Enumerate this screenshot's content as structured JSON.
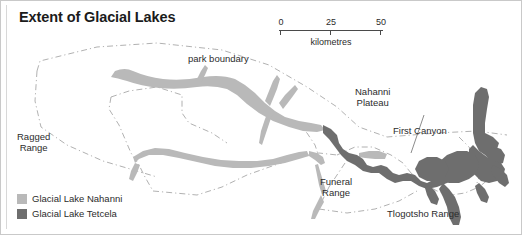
{
  "figure": {
    "title": "Extent of Glacial Lakes",
    "border_color": "#c9c9c9",
    "background": "#ffffff"
  },
  "scalebar": {
    "ticks": [
      "0",
      "25",
      "50"
    ],
    "unit_label": "kilometres",
    "line_color": "#4a4a4a"
  },
  "legend": {
    "items": [
      {
        "label": "Glacial Lake Nahanni",
        "color": "#b9b9b9"
      },
      {
        "label": "Glacial Lake Tetcela",
        "color": "#6e6e6e"
      }
    ]
  },
  "map_labels": {
    "park_boundary": "park boundary",
    "ragged_range": "Ragged\nRange",
    "nahanni_plateau": "Nahanni\nPlateau",
    "first_canyon": "First Canyon",
    "funeral_range": "Funeral\nRange",
    "tlogotsho_range": "Tlogotsho Range"
  },
  "map_colors": {
    "glacial_lake_nahanni": "#b9b9b9",
    "glacial_lake_tetcela": "#6e6e6e",
    "park_boundary_line": "#9a9a9a"
  }
}
